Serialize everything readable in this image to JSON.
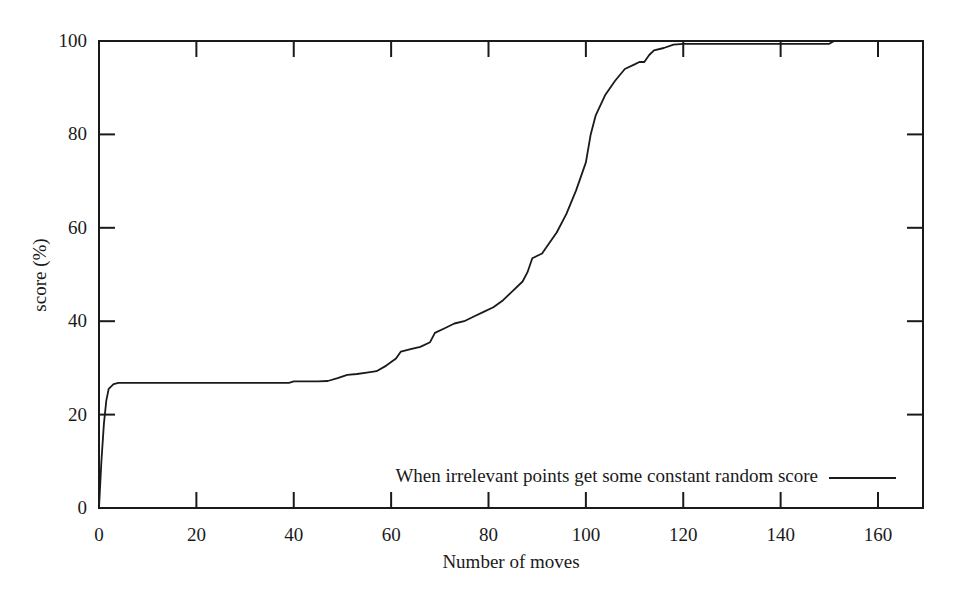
{
  "chart_data": {
    "type": "line",
    "title": "",
    "xlabel": "Number of moves",
    "ylabel": "score (%)",
    "xlim": [
      0,
      168
    ],
    "ylim": [
      0,
      100
    ],
    "xticks": [
      0,
      20,
      40,
      60,
      80,
      100,
      120,
      140,
      160
    ],
    "yticks": [
      0,
      20,
      40,
      60,
      80,
      100
    ],
    "grid": false,
    "legend_position": "lower right (inside)",
    "series": [
      {
        "name": "When irrelevant points get some constant random score",
        "color": "#1a1a1a",
        "x": [
          0,
          0.5,
          1,
          1.5,
          2,
          3,
          4,
          6,
          10,
          20,
          30,
          39,
          40,
          45,
          47,
          49,
          51,
          53,
          55,
          57,
          59,
          61,
          62,
          64,
          66,
          68,
          69,
          71,
          73,
          75,
          77,
          79,
          81,
          83,
          85,
          87,
          88,
          89,
          91,
          92,
          94,
          96,
          98,
          99,
          100,
          101,
          102,
          104,
          106,
          108,
          110,
          111,
          112,
          113,
          114,
          116,
          118,
          120,
          125,
          130,
          140,
          150,
          151,
          160,
          168
        ],
        "y": [
          0,
          10,
          18,
          23,
          25.5,
          26.5,
          26.8,
          26.8,
          26.8,
          26.8,
          26.8,
          26.8,
          27.1,
          27.1,
          27.2,
          27.8,
          28.5,
          28.7,
          29.0,
          29.3,
          30.5,
          32.0,
          33.5,
          34.0,
          34.5,
          35.5,
          37.5,
          38.5,
          39.5,
          40.0,
          41.0,
          42.0,
          43.0,
          44.5,
          46.5,
          48.5,
          50.5,
          53.5,
          54.5,
          56.0,
          59.0,
          63.0,
          68.0,
          71.0,
          74.0,
          80.0,
          84.0,
          88.5,
          91.5,
          94.0,
          95.0,
          95.5,
          95.5,
          97.0,
          98.0,
          98.5,
          99.2,
          99.4,
          99.4,
          99.4,
          99.4,
          99.4,
          100,
          100,
          100
        ]
      }
    ],
    "annotations": []
  },
  "legend": {
    "label": "When irrelevant points get some constant random score"
  },
  "axes": {
    "x_title": "Number of moves",
    "y_title": "score (%)"
  }
}
